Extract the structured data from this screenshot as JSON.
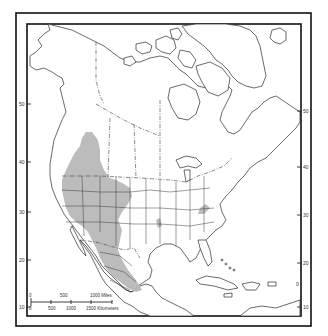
{
  "map": {
    "subject": "North America range map",
    "range_color": "#b8b8b8",
    "frame_color": "#111111",
    "range_description": "Shaded range covering western North America from British Columbia and Alberta south through the western U.S. Great Basin and Rocky Mountain states into the Mexican highlands, with small isolated patches in the central Plains and Appalachians",
    "latitude_labels_left": [
      {
        "value": "50",
        "y": 104
      },
      {
        "value": "40",
        "y": 162
      },
      {
        "value": "30",
        "y": 212
      },
      {
        "value": "20",
        "y": 260
      },
      {
        "value": "10",
        "y": 307
      }
    ],
    "latitude_labels_right": [
      {
        "value": "50",
        "y": 111
      },
      {
        "value": "40",
        "y": 167
      },
      {
        "value": "30",
        "y": 215
      },
      {
        "value": "20",
        "y": 263
      },
      {
        "value": "10",
        "y": 307
      }
    ],
    "extra_label_right": "0",
    "scale_bar": {
      "miles_labels": [
        "0",
        "500",
        "1000 Miles"
      ],
      "km_labels": [
        "0",
        "500",
        "1000",
        "1500 Kilometers"
      ]
    }
  }
}
